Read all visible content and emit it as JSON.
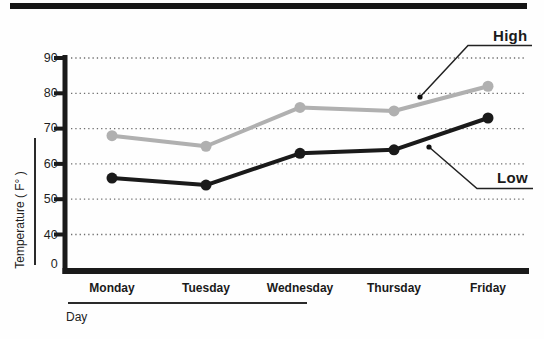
{
  "chart_data": {
    "type": "line",
    "title": "",
    "xlabel": "Day",
    "ylabel": "Temperature ( F° )",
    "categories": [
      "Monday",
      "Tuesday",
      "Wednesday",
      "Thursday",
      "Friday"
    ],
    "series": [
      {
        "name": "High",
        "values": [
          68,
          65,
          76,
          75,
          82
        ],
        "color": "#b0b0b0"
      },
      {
        "name": "Low",
        "values": [
          56,
          54,
          63,
          64,
          73
        ],
        "color": "#1a1a1a"
      }
    ],
    "yticks": [
      90,
      80,
      70,
      60,
      50,
      40,
      0
    ],
    "ylim": [
      40,
      90
    ],
    "axis_break": "y axis jumps from 0 to 40",
    "grid": "dotted horizontal gridlines at each labeled y tick (40-90)",
    "legend_position": "direct labels with leader lines, right side",
    "axis_color": "#1a1a1a",
    "gridline_color": "#6e6e6e"
  }
}
